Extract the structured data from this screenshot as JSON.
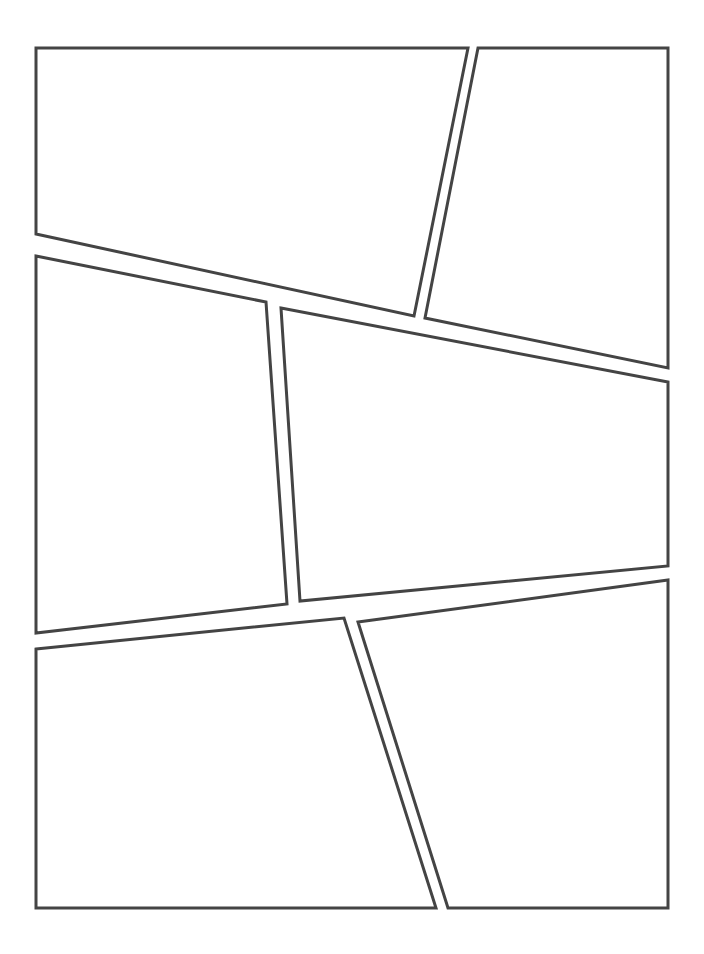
{
  "document": {
    "type": "comic-page-layout-template",
    "title": "Comic Page Panel Layout",
    "page_width": 704,
    "page_height": 954,
    "background_color": "#ffffff",
    "panel_count": 6
  },
  "style": {
    "border_color": "#444444",
    "border_width": 3,
    "panel_fill": "#ffffff",
    "gutter_color": "#ffffff"
  },
  "panels": [
    {
      "id": "panel-1",
      "label": "Panel 1",
      "row": "top",
      "position": "top-left",
      "shape": "quadrilateral",
      "points": "36,48 468,48 414,316 36,234"
    },
    {
      "id": "panel-2",
      "label": "Panel 2",
      "row": "top",
      "position": "top-right",
      "shape": "quadrilateral",
      "points": "478,48 668,48 668,368 425,318"
    },
    {
      "id": "panel-3",
      "label": "Panel 3",
      "row": "middle",
      "position": "middle-left",
      "shape": "quadrilateral",
      "points": "36,256 266,302 287,604 36,633"
    },
    {
      "id": "panel-4",
      "label": "Panel 4",
      "row": "middle",
      "position": "middle-right",
      "shape": "quadrilateral",
      "points": "281,308 668,382 668,566 300,601"
    },
    {
      "id": "panel-5",
      "label": "Panel 5",
      "row": "bottom",
      "position": "bottom-left",
      "shape": "quadrilateral",
      "points": "36,649 344,618 436,908 36,908"
    },
    {
      "id": "panel-6",
      "label": "Panel 6",
      "row": "bottom",
      "position": "bottom-right",
      "shape": "quadrilateral",
      "points": "358,622 668,580 668,908 448,908"
    }
  ]
}
